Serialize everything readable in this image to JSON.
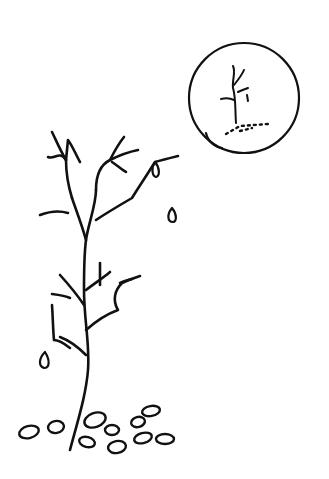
{
  "scene": {
    "description": "Black ink line drawing of a bare sapling with falling leaves and a circular inset showing a tiny tree",
    "background_color": "#ffffff",
    "ink_color": "#111111",
    "elements": {
      "tree": "bare-sapling",
      "inset": "circle-with-small-tree",
      "falling_leaves": 3,
      "ground_leaves": 11
    }
  }
}
